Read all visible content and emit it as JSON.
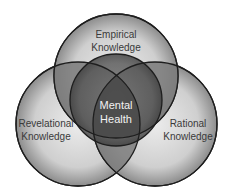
{
  "diagram": {
    "type": "venn",
    "circles": [
      {
        "id": "empirical",
        "label_line1": "Empirical",
        "label_line2": "Knowledge",
        "cx": 116,
        "cy": 76,
        "r": 62
      },
      {
        "id": "revelational",
        "label_line1": "Revelational",
        "label_line2": "Knowledge",
        "cx": 78,
        "cy": 124,
        "r": 62
      },
      {
        "id": "rational",
        "label_line1": "Rational",
        "label_line2": "Knowledge",
        "cx": 155,
        "cy": 124,
        "r": 62
      }
    ],
    "center": {
      "label_line1": "Mental",
      "label_line2": "Health",
      "cx": 116,
      "cy": 100,
      "r": 46
    },
    "colors": {
      "outline": "#1e1e1e",
      "fill_light": "#d8d8d8",
      "fill_mid": "#8a8a8a",
      "fill_dark": "#4a4a4a",
      "text_dark": "#3a3a3a",
      "text_light": "#f2f2f2"
    }
  }
}
